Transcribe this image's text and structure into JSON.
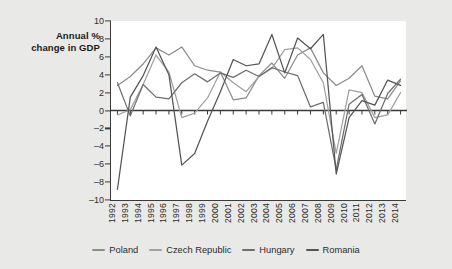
{
  "chart_data": {
    "type": "line",
    "title": "",
    "subtitle": "",
    "ylabel": "Annual %\nchange in GDP",
    "ylabel_line1": "Annual %",
    "ylabel_line2": "change in GDP",
    "xlabel": "",
    "ylim": [
      -10,
      10
    ],
    "yticks": [
      10,
      8,
      6,
      4,
      2,
      0,
      -2,
      -4,
      -6,
      -8,
      -10
    ],
    "ytick_labels": [
      "10",
      "8",
      "6",
      "4",
      "2",
      "0",
      "–2",
      "–4",
      "–6",
      "–8",
      "–10"
    ],
    "grid": false,
    "legend_position": "bottom",
    "zero_line": true,
    "categories": [
      "1992",
      "1993",
      "1994",
      "1995",
      "1996",
      "1997",
      "1998",
      "1999",
      "2000",
      "2001",
      "2002",
      "2003",
      "2004",
      "2005",
      "2006",
      "2007",
      "2008",
      "2009",
      "2010",
      "2011",
      "2012",
      "2013",
      "2014"
    ],
    "x": [
      1992,
      1993,
      1994,
      1995,
      1996,
      1997,
      1998,
      1999,
      2000,
      2001,
      2002,
      2003,
      2004,
      2005,
      2006,
      2007,
      2008,
      2009,
      2010,
      2011,
      2012,
      2013,
      2014
    ],
    "series": [
      {
        "name": "Poland",
        "color": "#8c8c8c",
        "values": [
          2.8,
          3.8,
          5.2,
          7.0,
          6.2,
          7.1,
          5.0,
          4.5,
          4.3,
          1.2,
          1.4,
          3.9,
          5.3,
          3.6,
          6.2,
          7.0,
          4.2,
          2.8,
          3.6,
          5.0,
          1.6,
          1.3,
          3.3
        ]
      },
      {
        "name": "Czech Republic",
        "color": "#a0a0a0",
        "values": [
          -0.5,
          0.1,
          2.9,
          6.2,
          4.3,
          -0.8,
          -0.3,
          1.4,
          4.3,
          3.1,
          2.1,
          3.8,
          4.7,
          6.8,
          7.0,
          5.7,
          3.1,
          -4.8,
          2.3,
          2.0,
          -0.8,
          -0.5,
          2.0
        ]
      },
      {
        "name": "Hungary",
        "color": "#6e6e6e",
        "values": [
          3.1,
          -0.6,
          2.9,
          1.5,
          1.3,
          3.1,
          4.1,
          3.2,
          4.2,
          3.7,
          4.5,
          3.8,
          4.8,
          4.3,
          3.9,
          0.4,
          0.9,
          -6.6,
          0.7,
          1.8,
          -1.5,
          1.9,
          3.5
        ]
      },
      {
        "name": "Romania",
        "color": "#555555",
        "values": [
          -8.8,
          1.5,
          3.9,
          7.1,
          4.0,
          -6.1,
          -4.8,
          -1.2,
          2.1,
          5.7,
          5.0,
          5.2,
          8.5,
          4.2,
          8.1,
          6.9,
          8.5,
          -7.1,
          -0.8,
          1.1,
          0.6,
          3.4,
          2.8
        ]
      }
    ]
  },
  "legend": {
    "items": [
      {
        "label": "Poland",
        "color": "#8c8c8c"
      },
      {
        "label": "Czech Republic",
        "color": "#a0a0a0"
      },
      {
        "label": "Hungary",
        "color": "#6e6e6e"
      },
      {
        "label": "Romania",
        "color": "#555555"
      }
    ]
  },
  "colors": {
    "background": "#e9e9e7",
    "plot_background": "#ffffff",
    "axis": "#3a3a3a",
    "text": "#2c2c2c"
  }
}
